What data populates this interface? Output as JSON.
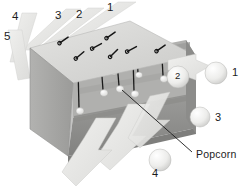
{
  "figure": {
    "type": "technical-diagram",
    "background_color": "#ffffff",
    "palette": {
      "box_top": "#d9d9d7",
      "box_front_left": "#a8a8a6",
      "box_interior_floor": "#8e8e8c",
      "box_interior_back": "#b4b4b2",
      "arrow_fill": "#e2e2e0",
      "arrow_stroke": "#cfcfcd",
      "string": "#1a1a1a",
      "popcorn": "#f2f2f0",
      "ball": "#ededeb",
      "text": "#1c1c1c"
    }
  },
  "input_labels": [
    {
      "id": "in-1",
      "text": "1",
      "x": 107,
      "y": 4
    },
    {
      "id": "in-2",
      "text": "2",
      "x": 76,
      "y": 11
    },
    {
      "id": "in-3",
      "text": "3",
      "x": 55,
      "y": 12
    },
    {
      "id": "in-4",
      "text": "4",
      "x": 12,
      "y": 13
    },
    {
      "id": "in-5",
      "text": "5",
      "x": 4,
      "y": 33
    }
  ],
  "output_labels": [
    {
      "id": "out-1",
      "text": "1",
      "x": 232,
      "y": 73
    },
    {
      "id": "out-3",
      "text": "3",
      "x": 215,
      "y": 118
    },
    {
      "id": "out-4",
      "text": "4",
      "x": 152,
      "y": 173
    }
  ],
  "interior_labels": [
    {
      "id": "ball-2",
      "text": "2",
      "x": 176,
      "y": 74
    }
  ],
  "callouts": [
    {
      "id": "popcorn-callout",
      "text": "Popcorn",
      "x": 196,
      "y": 155
    }
  ],
  "popcorn_strings": [
    {
      "id": "string-1",
      "top_x": 78,
      "top_y": 68,
      "bottom_x": 79,
      "bottom_y": 110
    },
    {
      "id": "string-2",
      "top_x": 101,
      "top_y": 63,
      "bottom_x": 103,
      "bottom_y": 93
    },
    {
      "id": "string-3",
      "top_x": 112,
      "top_y": 57,
      "bottom_x": 114,
      "bottom_y": 72
    },
    {
      "id": "string-4",
      "top_x": 117,
      "top_y": 62,
      "bottom_x": 119,
      "bottom_y": 89
    },
    {
      "id": "string-5",
      "top_x": 133,
      "top_y": 58,
      "bottom_x": 134,
      "bottom_y": 94
    },
    {
      "id": "string-6",
      "top_x": 137,
      "top_y": 57,
      "bottom_x": 139,
      "bottom_y": 75
    },
    {
      "id": "string-7",
      "top_x": 162,
      "top_y": 57,
      "bottom_x": 163,
      "bottom_y": 79
    }
  ],
  "tie_marks": [
    {
      "id": "tie-1",
      "x": 64,
      "y": 40,
      "rot": -35
    },
    {
      "id": "tie-2",
      "x": 80,
      "y": 54,
      "rot": -40
    },
    {
      "id": "tie-3",
      "x": 96,
      "y": 46,
      "rot": -30
    },
    {
      "id": "tie-4",
      "x": 110,
      "y": 36,
      "rot": -35
    },
    {
      "id": "tie-5",
      "x": 113,
      "y": 53,
      "rot": -45
    },
    {
      "id": "tie-6",
      "x": 131,
      "y": 49,
      "rot": -30
    },
    {
      "id": "tie-7",
      "x": 161,
      "y": 48,
      "rot": -35
    }
  ],
  "output_balls": [
    {
      "id": "ball-out-1",
      "cx": 216,
      "cy": 73,
      "r": 11
    },
    {
      "id": "ball-out-3",
      "cx": 200,
      "cy": 117,
      "r": 10
    },
    {
      "id": "ball-out-4",
      "cx": 160,
      "cy": 160,
      "r": 11
    },
    {
      "id": "ball-out-2",
      "cx": 178,
      "cy": 77,
      "r": 11
    }
  ]
}
